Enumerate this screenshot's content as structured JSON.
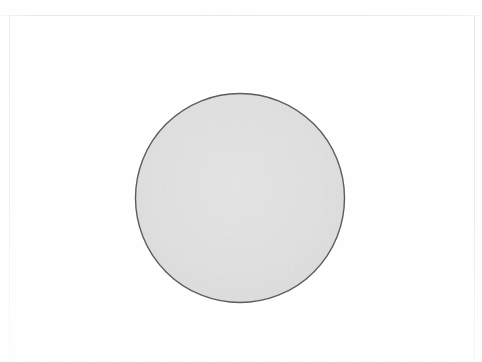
{
  "canvas": {
    "width": 482,
    "height": 362,
    "background_color": "#ffffff"
  },
  "page_frame": {
    "visible": true,
    "line_color": "#e9ebef",
    "top_rule_y": 15,
    "left_rule_x": 9,
    "right_rule_x": 474,
    "bottom_rule": "none"
  },
  "chart_data": {
    "type": "scatter",
    "title": "",
    "subtitle": "",
    "xlabel": "",
    "ylabel": "",
    "grid": false,
    "legend": "none",
    "axes_visible": false,
    "tick_labels_x": [],
    "tick_labels_y": [],
    "xlim": [
      0,
      482
    ],
    "ylim": [
      0,
      362
    ],
    "annotations": [],
    "shapes": [
      {
        "name": "circle",
        "kind": "circle",
        "cx": 240,
        "cy": 198,
        "r": 104.5,
        "fill": "#e2e2e2",
        "stroke": "#5e5e5e",
        "stroke_width": 1.4,
        "label": ""
      }
    ]
  },
  "figure": {
    "shape_name": "circle",
    "fill_color": "#e2e2e2",
    "stroke_color": "#5e5e5e",
    "stroke_width": 1.4,
    "center_x": 240,
    "center_y": 198,
    "radius": 104.5,
    "diameter": 209
  }
}
